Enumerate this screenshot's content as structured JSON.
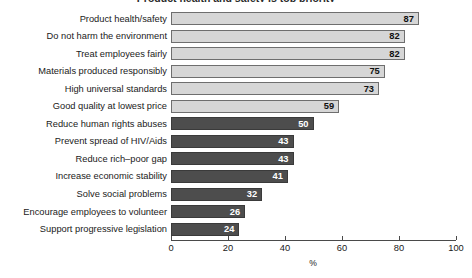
{
  "chart_data": {
    "type": "bar",
    "orientation": "horizontal",
    "title": "Product health and safety is top priority",
    "xlabel": "%",
    "ylabel": "",
    "xlim": [
      0,
      100
    ],
    "xticks": [
      0,
      20,
      40,
      60,
      80,
      100
    ],
    "grid": false,
    "legend": null,
    "categories": [
      "Product health/safety",
      "Do not harm the environment",
      "Treat employees fairly",
      "Materials produced responsibly",
      "High universal standards",
      "Good quality at lowest price",
      "Reduce human rights abuses",
      "Prevent spread of HIV/Aids",
      "Reduce rich–poor gap",
      "Increase economic stability",
      "Solve social problems",
      "Encourage employees to volunteer",
      "Support progressive legislation"
    ],
    "values": [
      87,
      82,
      82,
      75,
      73,
      59,
      50,
      43,
      43,
      41,
      32,
      26,
      24
    ],
    "bar_styles": [
      "light",
      "light",
      "light",
      "light",
      "light",
      "light",
      "dark",
      "dark",
      "dark",
      "dark",
      "dark",
      "dark",
      "dark"
    ],
    "colors": {
      "light_fill": "#d6d6d6",
      "light_border": "#6e6e6e",
      "dark_fill": "#4d4d4d",
      "dark_border": "#3a3a3a",
      "light_value_text": "#111111",
      "dark_value_text": "#ffffff",
      "axis": "#4a4a4a",
      "background": "#ffffff"
    }
  }
}
